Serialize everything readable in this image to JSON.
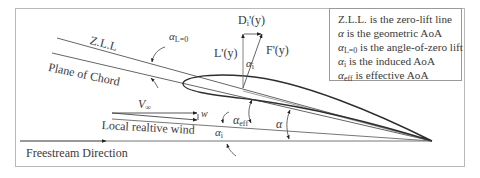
{
  "diagram": {
    "title": "",
    "type": "airfoil induced angle of attack diagram",
    "labels": {
      "zll": "Z.L.L",
      "plane_of_chord": "Plane of Chord",
      "alpha_l0": "α",
      "alpha_l0_sub": "L=0",
      "v_inf": "V",
      "v_inf_sub": "∞",
      "w": "w",
      "local_relative_wind": "Local realtive wind",
      "freestream_direction": "Freestream Direction",
      "alpha_eff": "α",
      "alpha_eff_sub": "eff",
      "alpha": "α",
      "alpha_i": "α",
      "alpha_i_sub": "i",
      "alpha_i_force": "α",
      "alpha_i_force_sub": "i",
      "lift": "L'(y)",
      "induced_drag": "D",
      "induced_drag_sub": "i",
      "induced_drag_suffix": "'(y)",
      "resultant_force": "F'(y)"
    },
    "legend": {
      "items": [
        {
          "symbol": "",
          "sub": "",
          "text": "Z.L.L. is the zero-lift line"
        },
        {
          "symbol": "α",
          "sub": "",
          "text": " is the geometric AoA"
        },
        {
          "symbol": "α",
          "sub": "L=0",
          "text": " is the angle-of-zero lift"
        },
        {
          "symbol": "α",
          "sub": "i",
          "text": " is the induced AoA"
        },
        {
          "symbol": "α",
          "sub": "eff",
          "text": " is effective AoA"
        }
      ]
    },
    "colors": {
      "line": "#555555",
      "airfoil": "#333333",
      "frame": "#b0b0b0",
      "text": "#3a3a3a"
    }
  }
}
